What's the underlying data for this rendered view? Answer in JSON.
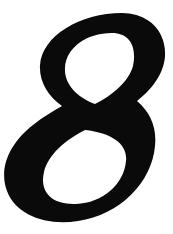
{
  "image": {
    "kind": "glyph-scan",
    "width": 173,
    "height": 234,
    "background_color": "#ffffff",
    "alt_text": "Numeral eight"
  },
  "glyph": {
    "character": "8",
    "name": "digit-eight",
    "style": "oblique-serif-heavy",
    "ink_color": "#0a0a0a",
    "bbox": {
      "x": 5,
      "y": 13,
      "width": 160,
      "height": 209
    },
    "waist": {
      "x": 85,
      "y": 112
    },
    "upper_bowl": {
      "cx": 104,
      "cy": 62,
      "rx": 62,
      "ry": 50
    },
    "lower_bowl": {
      "cx": 78,
      "cy": 168,
      "rx": 73,
      "ry": 55
    },
    "path": "M 122 13 C 142 13 160 24 164 44 C 169 66 156 86 137 101 C 150 112 157 127 155 146 C 152 182 120 215 78 221 C 46 226 16 215 7 191 C -2 167 11 142 33 125 C 43 117 53 111 62 106 C 48 96 39 82 40 65 C 42 36 80 13 122 13 Z M 112 33 C 86 33 66 48 65 68 C 64 83 76 97 95 104 C 113 95 129 81 133 66 C 137 47 130 33 112 33 Z M 85 130 C 65 140 48 155 44 172 C 39 193 53 205 76 204 C 103 203 124 184 126 161 C 128 145 113 133 85 130 Z"
  },
  "caption": ""
}
